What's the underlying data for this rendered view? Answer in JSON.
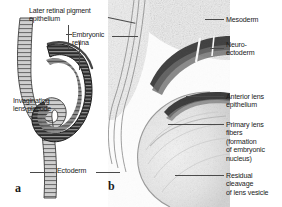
{
  "figure": {
    "type": "scientific-illustration",
    "background_color": "#ffffff",
    "text_color": "#1b1b1b",
    "leader_line_color": "#4a4a4a"
  },
  "panel_a": {
    "letter": "a",
    "style": "schematic line drawing",
    "labels": [
      {
        "id": "later-retinal-pigment-epithelium",
        "text": "Later retinal pigment\nepithelium",
        "x": 29,
        "y": 7
      },
      {
        "id": "embryonic-retina",
        "text": "Embryonic\nretina",
        "x": 72,
        "y": 31
      },
      {
        "id": "invaginating-lens-placode",
        "text": "Invaginating\nlens placode",
        "x": 13,
        "y": 97
      },
      {
        "id": "ectoderm",
        "text": "Ectoderm",
        "x": 57,
        "y": 167
      }
    ]
  },
  "panel_b": {
    "letter": "b",
    "style": "histological section micrograph",
    "labels": [
      {
        "id": "mesoderm",
        "text": "Mesoderm",
        "x": 226,
        "y": 16
      },
      {
        "id": "neuro-ectoderm",
        "text": "Neuro-\nectoderm",
        "x": 226,
        "y": 41
      },
      {
        "id": "anterior-lens-epithelium",
        "text": "Anterior lens\nepithelium",
        "x": 226,
        "y": 93
      },
      {
        "id": "primary-lens-fibers",
        "text": "Primary lens\nfibers\n(formation\nof embryonic\nnucleus)",
        "x": 226,
        "y": 121
      },
      {
        "id": "residual-cleavage-of-lens-vesicle",
        "text": "Residual\ncleavage\nof lens vesicle",
        "x": 226,
        "y": 172
      }
    ]
  }
}
